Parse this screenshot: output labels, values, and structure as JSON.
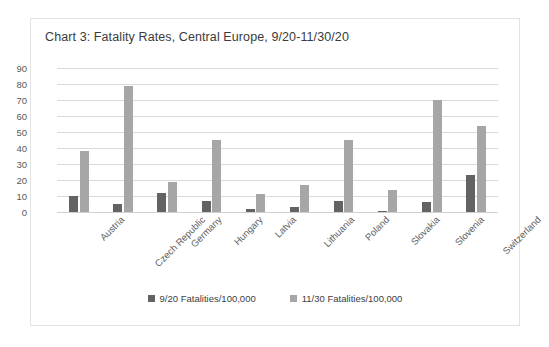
{
  "chart_data": {
    "type": "bar",
    "title": "Chart 3: Fatality Rates, Central Europe, 9/20-11/30/20",
    "xlabel": "",
    "ylabel": "",
    "ylim": [
      0,
      90
    ],
    "yticks": [
      90,
      80,
      70,
      60,
      50,
      40,
      30,
      20,
      10,
      0
    ],
    "grid": true,
    "legend_position": "bottom",
    "categories": [
      "Austria",
      "Czech Republic",
      "Germany",
      "Hungary",
      "Latvia",
      "Lithuania",
      "Poland",
      "Slovakia",
      "Slovenia",
      "Switzerland"
    ],
    "series": [
      {
        "name": "9/20 Fatalities/100,000",
        "color": "#636363",
        "values": [
          10,
          5,
          12,
          7,
          2,
          3,
          7,
          0.5,
          6,
          23
        ]
      },
      {
        "name": "11/30 Fatalities/100,000",
        "color": "#a6a6a6",
        "values": [
          38,
          79,
          19,
          45,
          11,
          17,
          45,
          14,
          70,
          54
        ]
      }
    ]
  }
}
